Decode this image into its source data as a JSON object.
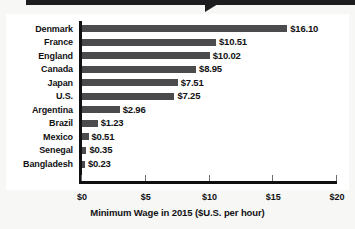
{
  "banner": {
    "name": "callout-banner",
    "color": "#1d1d1f",
    "text": ""
  },
  "chart_data": {
    "type": "bar",
    "orientation": "horizontal",
    "title": "",
    "xlabel": "Minimum Wage in 2015 ($U.S. per hour)",
    "ylabel": "",
    "xlim": [
      0,
      20
    ],
    "xticks": [
      0,
      5,
      10,
      15,
      20
    ],
    "xtick_labels": [
      "$0",
      "$5",
      "$10",
      "$15",
      "$20"
    ],
    "grid": false,
    "legend": null,
    "bar_color": "#4b4b4d",
    "categories": [
      "Denmark",
      "France",
      "England",
      "Canada",
      "Japan",
      "U.S.",
      "Argentina",
      "Brazil",
      "Mexico",
      "Senegal",
      "Bangladesh"
    ],
    "values": [
      16.1,
      10.51,
      10.02,
      8.95,
      7.51,
      7.25,
      2.96,
      1.23,
      0.51,
      0.35,
      0.23
    ],
    "value_labels": [
      "$16.10",
      "$10.51",
      "$10.02",
      "$8.95",
      "$7.51",
      "$7.25",
      "$2.96",
      "$1.23",
      "$0.51",
      "$0.35",
      "$0.23"
    ]
  }
}
